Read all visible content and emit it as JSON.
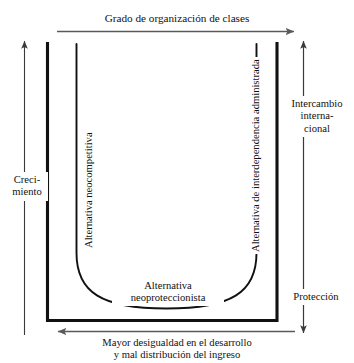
{
  "diagram": {
    "type": "u-curve-quadrant-diagram",
    "title_top_axis": "Grado de organización de clases",
    "bottom_axis": {
      "line1": "Mayor desigualdad en el desarrollo",
      "line2": "y mal distribución del ingreso"
    },
    "left_axis": {
      "line1": "Creci-",
      "line2": "miento"
    },
    "right_axis_upper": {
      "line1": "Intercambio",
      "line2": "interna-",
      "line3": "cional"
    },
    "right_axis_lower": {
      "line1": "Protección"
    },
    "curve_labels": {
      "left_arm": "Alternativa neocompetitiva",
      "right_arm": "Alternativa de interdependencia administrada",
      "bottom_center_line1": "Alternativa",
      "bottom_center_line2": "neoproteccionista"
    },
    "arrows": {
      "top_axis_direction": "right",
      "bottom_axis_direction": "left",
      "left_axis_direction": "up",
      "right_axis_direction": "both"
    },
    "colors": {
      "ink": "#111111",
      "rule": "#5a5a5a",
      "background": "#ffffff"
    }
  }
}
